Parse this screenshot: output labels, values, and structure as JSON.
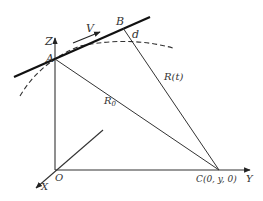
{
  "diagram": {
    "labels": {
      "z_axis": "Z",
      "y_axis": "Y",
      "x_axis": "X",
      "origin": "O",
      "point_a": "A",
      "point_b": "B",
      "point_c": "C(0, y, 0)",
      "velocity": "V",
      "distance": "d",
      "range_t": "R(t)",
      "range_0": "R",
      "range_0_sub": "0"
    },
    "colors": {
      "line": "#222222",
      "text": "#333333"
    }
  }
}
